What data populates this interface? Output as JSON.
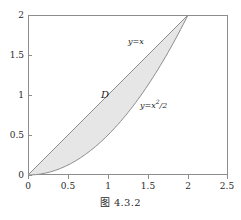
{
  "caption": "图 4.3.2",
  "colors": {
    "fill": "#e6e6e6",
    "curve": "#8d8d8d",
    "frame": "#8d8d8d",
    "text": "#2b2b2b",
    "background": "#ffffff"
  },
  "annotations": {
    "upper_curve_label": "y=x",
    "lower_curve_label_prefix": "y=x",
    "lower_curve_label_exp": "2",
    "lower_curve_label_suffix": "/2",
    "region_label": "D"
  },
  "axes": {
    "x_ticks": [
      "0",
      "0.5",
      "1",
      "1.5",
      "2",
      "2.5"
    ],
    "y_ticks": [
      "0",
      "0.5",
      "1",
      "1.5",
      "2"
    ]
  },
  "chart_data": {
    "type": "area",
    "title": "图 4.3.2",
    "xlabel": "",
    "ylabel": "",
    "xlim": [
      0,
      2.5
    ],
    "ylim": [
      0,
      2
    ],
    "grid": false,
    "legend": "none",
    "xticks": [
      0,
      0.5,
      1,
      1.5,
      2,
      2.5
    ],
    "yticks": [
      0,
      0.5,
      1,
      1.5,
      2
    ],
    "xticklabels": [
      "0",
      "0.5",
      "1",
      "1.5",
      "2",
      "2.5"
    ],
    "yticklabels": [
      "0",
      "0.5",
      "1",
      "1.5",
      "2"
    ],
    "shaded_region": {
      "name": "D",
      "fill": "#e6e6e6",
      "upper_boundary": "y=x",
      "lower_boundary": "y=x^2/2",
      "x_from": 0,
      "x_to": 2,
      "intersections": [
        [
          0,
          0
        ],
        [
          2,
          2
        ]
      ],
      "area": 1.3333
    },
    "series": [
      {
        "name": "y=x",
        "type": "line",
        "x": [
          0,
          0.25,
          0.5,
          0.75,
          1,
          1.25,
          1.5,
          1.75,
          2
        ],
        "values": [
          0,
          0.25,
          0.5,
          0.75,
          1,
          1.25,
          1.5,
          1.75,
          2
        ],
        "label_text": "y=x",
        "label_at": [
          1.25,
          1.65
        ]
      },
      {
        "name": "y=x^2/2",
        "type": "line",
        "x": [
          0,
          0.25,
          0.5,
          0.75,
          1,
          1.25,
          1.5,
          1.75,
          2
        ],
        "values": [
          0,
          0.03125,
          0.125,
          0.28125,
          0.5,
          0.78125,
          1.125,
          1.53125,
          2
        ],
        "label_text": "y=x²/2",
        "label_at": [
          1.4,
          0.95
        ]
      }
    ],
    "annotations": [
      {
        "text": "y=x",
        "x": 1.25,
        "y": 1.65
      },
      {
        "text": "y=x²/2",
        "x": 1.4,
        "y": 0.95
      },
      {
        "text": "D",
        "x": 0.95,
        "y": 1.0
      }
    ]
  }
}
